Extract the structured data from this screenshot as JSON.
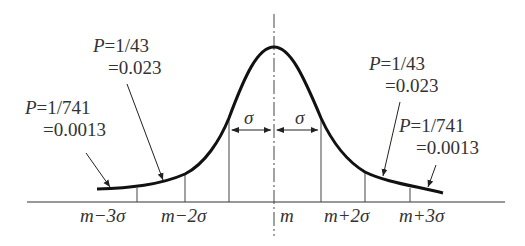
{
  "diagram": {
    "type": "normal-distribution-curve",
    "axis_labels": {
      "m_minus_3s": "m−3σ",
      "m_minus_2s": "m−2σ",
      "m": "m",
      "m_plus_2s": "m+2σ",
      "m_plus_3s": "m+3σ"
    },
    "sigma_labels": {
      "left": "σ",
      "right": "σ"
    },
    "annotations": {
      "left_2s": {
        "p": "P=1/43",
        "val": "=0.023"
      },
      "left_3s": {
        "p": "P=1/741",
        "val": "=0.0013"
      },
      "right_2s": {
        "p": "P=1/43",
        "val": "=0.023"
      },
      "right_3s": {
        "p": "P=1/741",
        "val": "=0.0013"
      }
    }
  }
}
